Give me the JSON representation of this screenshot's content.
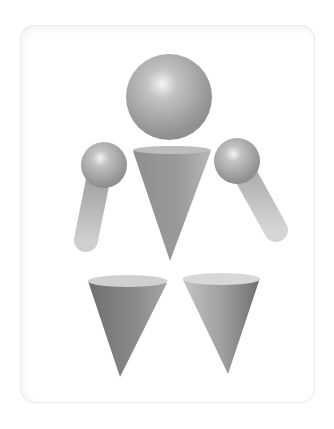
{
  "figure": {
    "parts": [
      {
        "name": "head",
        "shape": "sphere"
      },
      {
        "name": "body",
        "shape": "cone"
      },
      {
        "name": "left-shoulder",
        "shape": "sphere"
      },
      {
        "name": "right-shoulder",
        "shape": "sphere"
      },
      {
        "name": "left-arm",
        "shape": "cylinder"
      },
      {
        "name": "right-arm",
        "shape": "cylinder"
      },
      {
        "name": "left-leg",
        "shape": "cone"
      },
      {
        "name": "right-leg",
        "shape": "cone"
      }
    ]
  },
  "colors": {
    "background": "#ffffff",
    "card_border": "#ececec",
    "shape_light": "#d8d8d8",
    "shape_mid": "#a0a0a0",
    "shape_dark": "#6e6e6e"
  }
}
